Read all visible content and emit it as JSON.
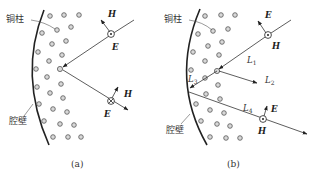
{
  "panels": [
    {
      "id": "a",
      "caption": "(a)",
      "labels": {
        "post": "铜柱",
        "wall": "腔壁"
      },
      "vectors": {
        "E1": "E",
        "H1": "H",
        "E2": "E",
        "H2": "H"
      }
    },
    {
      "id": "b",
      "caption": "(b)",
      "labels": {
        "post": "铜柱",
        "wall": "腔壁"
      },
      "vectors": {
        "E1": "E",
        "H1": "H",
        "E2": "E",
        "H2": "H"
      },
      "paths": {
        "L1": "L",
        "L1_sub": "1",
        "L2": "L",
        "L2_sub": "2",
        "L3": "L",
        "L3_sub": "3",
        "L4": "L",
        "L4_sub": "4"
      }
    }
  ],
  "symbols": {
    "out_of_page": "dot-in-circle",
    "into_page": "cross-in-circle"
  },
  "colors": {
    "line": "#222222",
    "post_fill": "#d8d8d8",
    "background": "#ffffff"
  }
}
